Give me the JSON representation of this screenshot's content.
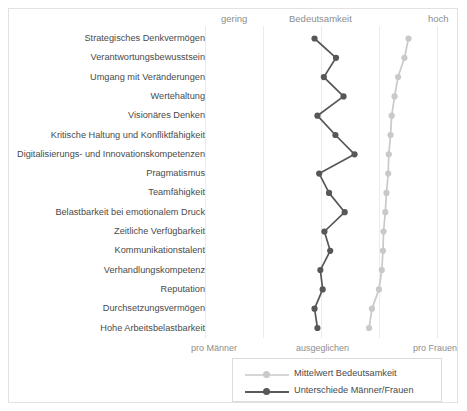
{
  "header": {
    "left_label": "gering",
    "center_label": "Bedeutsamkeit",
    "right_label": "hoch"
  },
  "footer": {
    "left_label": "pro Männer",
    "center_label": "ausgeglichen",
    "right_label": "pro Frauen"
  },
  "legend": {
    "items": [
      {
        "label": "Mittelwert Bedeutsamkeit",
        "color": "#c9c9c9"
      },
      {
        "label": "Unterschiede Männer/Frauen",
        "color": "#575757"
      }
    ]
  },
  "colors": {
    "series_light": "#c9c9c9",
    "series_dark": "#575757",
    "gridline": "#ebebeb",
    "border": "#e2e2e2",
    "text": "#4a4a4a",
    "axis_text": "#8d8d8d",
    "background": "#ffffff"
  },
  "chart_data": {
    "type": "line",
    "orientation": "horizontal",
    "title": "Bedeutsamkeit",
    "xlabel": "",
    "ylabel": "",
    "grid": true,
    "legend_position": "bottom",
    "xlim": [
      0,
      5
    ],
    "x_gridlines": [
      0,
      1,
      2,
      3,
      4
    ],
    "top_axis": {
      "label": "Bedeutsamkeit",
      "min_label": "gering",
      "max_label": "hoch"
    },
    "bottom_axis": {
      "label": "ausgeglichen",
      "min_label": "pro Männer",
      "max_label": "pro Frauen"
    },
    "categories": [
      "Strategisches Denkvermögen",
      "Verantwortungsbewusstsein",
      "Umgang mit Veränderungen",
      "Wertehaltung",
      "Visionäres Denken",
      "Kritische Haltung und Konfliktfähigkeit",
      "Digitalisierungs- und Innovationskompetenzen",
      "Pragmatismus",
      "Teamfähigkeit",
      "Belastbarkeit bei emotionalem Druck",
      "Zeitliche Verfügbarkeit",
      "Kommunikationstalent",
      "Verhandlungskompetenz",
      "Reputation",
      "Durchsetzungsvermögen",
      "Hohe Arbeitsbelastbarkeit"
    ],
    "series": [
      {
        "name": "Unterschiede Männer/Frauen",
        "color": "#575757",
        "values": [
          1.88,
          2.25,
          2.04,
          2.38,
          1.93,
          2.24,
          2.57,
          1.96,
          2.13,
          2.4,
          2.05,
          2.15,
          1.98,
          2.02,
          1.88,
          1.93
        ]
      },
      {
        "name": "Mittelwert Bedeutsamkeit",
        "color": "#c9c9c9",
        "values": [
          3.5,
          3.43,
          3.32,
          3.26,
          3.21,
          3.19,
          3.16,
          3.15,
          3.12,
          3.1,
          3.07,
          3.06,
          3.04,
          2.99,
          2.87,
          2.82
        ]
      }
    ]
  }
}
